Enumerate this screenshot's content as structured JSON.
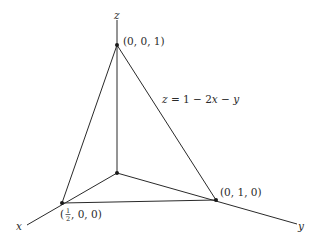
{
  "diagram": {
    "type": "3d-coordinate-sketch",
    "axes": {
      "x_label": "x",
      "y_label": "y",
      "z_label": "z"
    },
    "points": [
      {
        "id": "apex",
        "label": "(0, 0, 1)"
      },
      {
        "id": "y-intercept",
        "label": "(0, 1, 0)"
      },
      {
        "id": "x-intercept",
        "label_prefix": "(",
        "label_frac_num": "1",
        "label_frac_den": "2",
        "label_suffix": ", 0, 0)"
      },
      {
        "id": "origin",
        "label": ""
      }
    ],
    "plane_equation": {
      "lhs": "z",
      "eq": " = 1 − 2",
      "var1": "x",
      "minus": " − ",
      "var2": "y"
    },
    "colors": {
      "line": "#2a2a2a",
      "background": "#ffffff"
    }
  }
}
